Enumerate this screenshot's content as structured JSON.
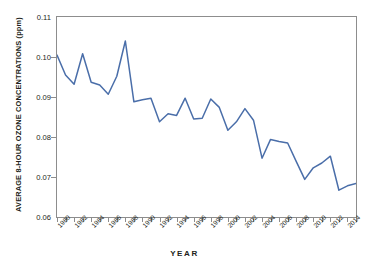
{
  "chart_data": {
    "type": "line",
    "title": "",
    "xlabel": "YEAR",
    "ylabel": "AVERAGE 8-HOUR OZONE CONCENTRATIONS (ppm)",
    "ylim": [
      0.06,
      0.11
    ],
    "xlim": [
      1980,
      2015
    ],
    "grid": false,
    "legend": "none",
    "line_color": "#4a6ea9",
    "axis_color": "#8d8d8d",
    "text_color": "#231f20",
    "y_ticks": [
      "0.06",
      "0.07",
      "0.08",
      "0.09",
      "0.10",
      "0.11"
    ],
    "y_tick_values": [
      0.06,
      0.07,
      0.08,
      0.09,
      0.1,
      0.11
    ],
    "x_ticks": [
      "1980",
      "1982",
      "1984",
      "1986",
      "1988",
      "1990",
      "1992",
      "1994",
      "1996",
      "1998",
      "2000",
      "2002",
      "2004",
      "2006",
      "2008",
      "2010",
      "2012",
      "2014"
    ],
    "x_tick_values": [
      1980,
      1982,
      1984,
      1986,
      1988,
      1990,
      1992,
      1994,
      1996,
      1998,
      2000,
      2002,
      2004,
      2006,
      2008,
      2010,
      2012,
      2014
    ],
    "x_tick_minor_values": [
      1981,
      1983,
      1985,
      1987,
      1989,
      1991,
      1993,
      1995,
      1997,
      1999,
      2001,
      2003,
      2005,
      2007,
      2009,
      2011,
      2013,
      2015
    ],
    "x": [
      1980,
      1981,
      1982,
      1983,
      1984,
      1985,
      1986,
      1987,
      1988,
      1989,
      1990,
      1991,
      1992,
      1993,
      1994,
      1995,
      1996,
      1997,
      1998,
      1999,
      2000,
      2001,
      2002,
      2003,
      2004,
      2005,
      2006,
      2007,
      2008,
      2009,
      2010,
      2011,
      2012,
      2013,
      2014,
      2015
    ],
    "values": [
      0.1005,
      0.0955,
      0.0932,
      0.1008,
      0.0937,
      0.093,
      0.0907,
      0.0952,
      0.104,
      0.0888,
      0.0893,
      0.0897,
      0.0838,
      0.0858,
      0.0854,
      0.0897,
      0.0845,
      0.0847,
      0.0895,
      0.0874,
      0.0817,
      0.0838,
      0.0871,
      0.0842,
      0.0747,
      0.0794,
      0.0789,
      0.0785,
      0.0739,
      0.0694,
      0.0723,
      0.0735,
      0.0752,
      0.0667,
      0.0678,
      0.0684
    ],
    "series_name": "Average 8-hour ozone concentration"
  },
  "axes": {
    "y_title": "AVERAGE 8-HOUR OZONE CONCENTRATIONS (ppm)",
    "x_title": "YEAR"
  }
}
